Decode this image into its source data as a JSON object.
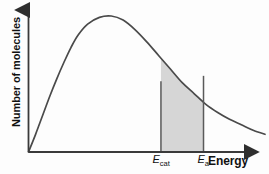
{
  "chart_data": {
    "type": "line",
    "title": "",
    "xlabel": "Energy",
    "ylabel": "Number of molecules",
    "grid": false,
    "legend": null,
    "axis_style": "arrow-ended axes, no numeric tick values",
    "curve_name": "Maxwell-Boltzmann distribution",
    "x": [
      0,
      3,
      6,
      9,
      12,
      15,
      18,
      21,
      25,
      30,
      35,
      40,
      45,
      50,
      55,
      60,
      65,
      70,
      75,
      80,
      85,
      90,
      95,
      100
    ],
    "y": [
      0,
      13,
      27,
      41,
      54,
      66,
      77,
      86,
      94,
      99,
      100,
      97,
      90,
      81,
      71,
      61,
      51,
      43,
      35,
      29,
      24,
      20,
      16,
      13
    ],
    "xlim": [
      0,
      100
    ],
    "ylim": [
      0,
      100
    ],
    "annotations": [
      {
        "name": "E_cat",
        "label_main": "E",
        "label_sub": "cat",
        "x": 56,
        "line_top_y": 52,
        "description": "activation energy with catalyst"
      },
      {
        "name": "E_a",
        "label_main": "E",
        "label_sub": "a",
        "x": 74,
        "line_top_y": 56,
        "description": "activation energy without catalyst"
      }
    ],
    "shaded_regions": [
      {
        "name": "molecules-with-energy-above-Ecat",
        "from_x": 56,
        "to_x": 74,
        "fill": "#d6d6d6"
      }
    ],
    "colors": {
      "curve": "#4a4a4a",
      "axis": "#3a3a3a",
      "marker_line": "#5a5a5a",
      "shade": "#d6d6d6",
      "text": "#111111",
      "background": "#fdfdfd"
    }
  },
  "labels": {
    "y_axis": "Number of molecules",
    "x_axis": "Energy",
    "ecat_main": "E",
    "ecat_sub": "cat",
    "ea_main": "E",
    "ea_sub": "a"
  }
}
